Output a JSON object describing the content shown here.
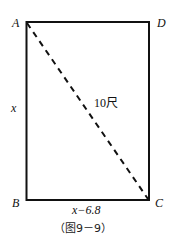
{
  "diagram": {
    "vertices": {
      "A": {
        "label": "A"
      },
      "B": {
        "label": "B"
      },
      "C": {
        "label": "C"
      },
      "D": {
        "label": "D"
      }
    },
    "side_left_label": "x",
    "side_bottom_label": "x−6.8",
    "diagonal_label": "10尺",
    "caption": "（图9－9）",
    "colors": {
      "stroke": "#111111",
      "background": "#ffffff"
    }
  }
}
